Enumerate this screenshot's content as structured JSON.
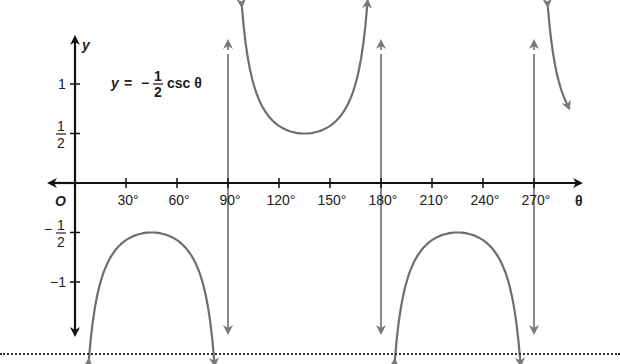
{
  "chart_data": {
    "type": "line",
    "equation": {
      "lhs": "y",
      "eq": "=",
      "minus": "−",
      "num": "1",
      "den": "2",
      "func": "csc θ"
    },
    "xlabel": "θ",
    "ylabel": "y",
    "origin_label": "O",
    "x_ticks": [
      30,
      60,
      90,
      120,
      150,
      180,
      210,
      240,
      270
    ],
    "x_tick_labels": [
      "30°",
      "60°",
      "90°",
      "120°",
      "150°",
      "180°",
      "210°",
      "240°",
      "270°"
    ],
    "y_ticks": [
      1,
      0.5,
      -0.5,
      -1
    ],
    "y_tick_labels": [
      "1",
      "1/2",
      "−1/2",
      "−1"
    ],
    "xlim": [
      0,
      285
    ],
    "ylim": [
      -1.5,
      1.5
    ],
    "asymptotes": [
      90,
      180,
      270
    ],
    "series": [
      {
        "name": "branch-1",
        "x_range": [
          8,
          82
        ],
        "extremum": {
          "x": 45,
          "y": -0.5
        },
        "direction": "down"
      },
      {
        "name": "branch-2",
        "x_range": [
          98,
          172
        ],
        "extremum": {
          "x": 135,
          "y": 0.5
        },
        "direction": "up"
      },
      {
        "name": "branch-3",
        "x_range": [
          188,
          262
        ],
        "extremum": {
          "x": 225,
          "y": -0.5
        },
        "direction": "down"
      },
      {
        "name": "branch-4",
        "x_range": [
          278,
          290
        ],
        "extremum": null,
        "direction": "up-partial"
      }
    ],
    "colors": {
      "axis": "#111111",
      "curve": "#6e6e6e",
      "asymptote": "#8a8a8a"
    },
    "grid": false
  }
}
